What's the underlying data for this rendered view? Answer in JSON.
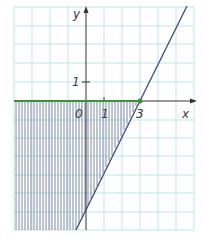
{
  "diagram": {
    "type": "coordinate-plane-inequality",
    "axes": {
      "x_label": "x",
      "y_label": "y",
      "origin_label": "0",
      "x_tick_labels": [
        {
          "value": 1,
          "text": "1"
        },
        {
          "value": 3,
          "text": "3"
        }
      ],
      "y_tick_labels": [
        {
          "value": 1,
          "text": "1"
        }
      ]
    },
    "grid": {
      "x_range": [
        -4,
        6
      ],
      "y_range": [
        -7,
        5
      ],
      "unit": 1
    },
    "line": {
      "equation": "y = 2x - 6",
      "intercept_point": [
        3,
        0
      ]
    },
    "boundary": {
      "equation": "y = 0",
      "from_x": -4,
      "to_x": 3
    },
    "shaded_region": "x-axis below, left of line y = 2x - 6 (hatched with vertical lines)",
    "colors": {
      "grid": "#bfe6ea",
      "axis": "#333333",
      "line": "#3a4a7a",
      "boundary": "#3f8f3f",
      "point": "#3f8f3f",
      "hatch": "#5a6a8a"
    }
  }
}
